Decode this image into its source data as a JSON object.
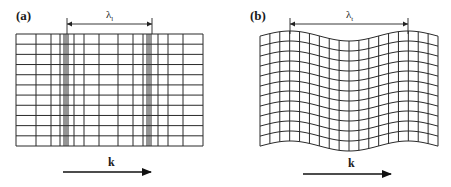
{
  "figure": {
    "colors": {
      "line": "#2a2a2a",
      "background": "#ffffff",
      "text": "#1a1a1a"
    },
    "panels": [
      {
        "id": "a",
        "label": "(a)",
        "label_pos": [
          16,
          20
        ],
        "kind": "longitudinal-compression-grid",
        "grid": {
          "x0": 16,
          "x1": 203,
          "y0": 34,
          "y1": 146,
          "vertical_lines_x": [
            16,
            36,
            51,
            60,
            64,
            66,
            68,
            74,
            84,
            99,
            118,
            133,
            143,
            147,
            149,
            151,
            158,
            168,
            183,
            203
          ],
          "rows": 11
        },
        "wavelength": {
          "symbol": "λ",
          "subscript": "l",
          "x_start": 67,
          "x_end": 152,
          "y": 24,
          "label_x": 106,
          "label_y": 18
        },
        "wavevector": {
          "label": "k",
          "x_start": 63,
          "x_end": 151,
          "y": 172,
          "label_x": 108,
          "label_y": 166
        }
      },
      {
        "id": "b",
        "label": "(b)",
        "label_pos": [
          250,
          20
        ],
        "kind": "transverse-shear-grid",
        "grid": {
          "x0": 260,
          "x1": 438,
          "y_top": 36,
          "row_spacing": 10,
          "rows": 11,
          "columns": 18,
          "amplitude": 5,
          "wave_peak_x": 290,
          "wavelength_px": 118
        },
        "wavelength": {
          "symbol": "λ",
          "subscript": "t",
          "x_start": 290,
          "x_end": 408,
          "y": 24,
          "label_x": 346,
          "label_y": 18
        },
        "wavevector": {
          "label": "k",
          "x_start": 303,
          "x_end": 391,
          "y": 174,
          "label_x": 348,
          "label_y": 167
        }
      }
    ]
  }
}
